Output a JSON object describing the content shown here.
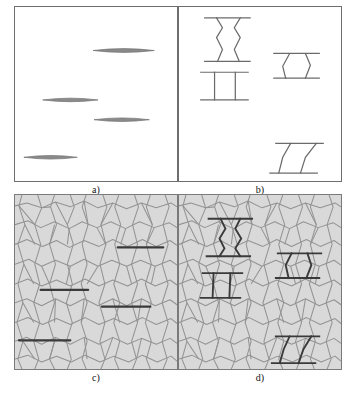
{
  "figure": {
    "panels": [
      {
        "id": "a",
        "caption": "a)",
        "kind": "line-drawing",
        "description": "Four isolated lens-shaped (penny) cracks on blank background",
        "background_color": "#ffffff",
        "border_color": "#6e6e6e",
        "crack_color": "#7d7d7d"
      },
      {
        "id": "b",
        "caption": "b)",
        "kind": "line-drawing",
        "description": "Four bridged cracks: hourglass, ladder, trapezoid and slanted bridge ligaments",
        "background_color": "#ffffff",
        "border_color": "#6e6e6e",
        "crack_color": "#6b6b6b"
      },
      {
        "id": "c",
        "caption": "c)",
        "kind": "grain-microstructure",
        "description": "Voronoi grain microstructure with four unbridged transgranular cracks",
        "background_color": "#d9d9d9",
        "grain_fill": "#d9d9d9",
        "grain_boundary_color": "#939393",
        "crack_color": "#3a3a3a"
      },
      {
        "id": "d",
        "caption": "d)",
        "kind": "grain-microstructure",
        "description": "Same Voronoi grain microstructure with four bridged cracks overlaid",
        "background_color": "#d9d9d9",
        "grain_fill": "#d9d9d9",
        "grain_boundary_color": "#939393",
        "crack_color": "#3a3a3a"
      }
    ],
    "panel_a_cracks": [
      {
        "cx": 110,
        "cy": 44,
        "half_length": 31,
        "half_height": 2.1
      },
      {
        "cx": 56,
        "cy": 94,
        "half_length": 28,
        "half_height": 2.0
      },
      {
        "cx": 108,
        "cy": 114,
        "half_length": 28,
        "half_height": 2.0
      },
      {
        "cx": 36,
        "cy": 152,
        "half_length": 27,
        "half_height": 2.0
      }
    ],
    "panel_b_cracks": [
      {
        "name": "hourglass-bridge",
        "x": 28,
        "y": 10,
        "width": 42,
        "height": 45
      },
      {
        "name": "ladder-bridge",
        "x": 24,
        "y": 65,
        "width": 42,
        "height": 30
      },
      {
        "name": "trapezoid-bridge",
        "x": 98,
        "y": 46,
        "width": 44,
        "height": 26
      },
      {
        "name": "slanted-bridge",
        "x": 96,
        "y": 137,
        "width": 50,
        "height": 32
      }
    ],
    "panel_c_cracks": [
      {
        "x1": 104,
        "y1": 53,
        "x2": 150,
        "y2": 53
      },
      {
        "x1": 26,
        "y1": 96,
        "x2": 74,
        "y2": 96
      },
      {
        "x1": 88,
        "y1": 113,
        "x2": 137,
        "y2": 113
      },
      {
        "x1": 6,
        "y1": 147,
        "x2": 56,
        "y2": 147
      }
    ],
    "panel_d_cracks": [
      {
        "name": "hourglass-bridge",
        "x": 30,
        "y": 22,
        "width": 42,
        "height": 42
      },
      {
        "name": "ladder-bridge",
        "x": 26,
        "y": 78,
        "width": 38,
        "height": 28
      },
      {
        "name": "trapezoid-bridge",
        "x": 100,
        "y": 58,
        "width": 42,
        "height": 26
      },
      {
        "name": "slanted-bridge",
        "x": 96,
        "y": 142,
        "width": 46,
        "height": 28
      }
    ]
  }
}
